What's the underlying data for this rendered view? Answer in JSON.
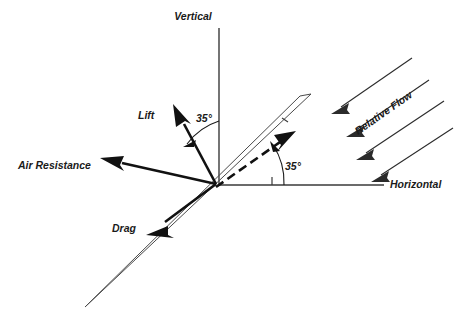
{
  "diagram": {
    "axes": [
      {
        "id": "vertical",
        "label": "Vertical"
      },
      {
        "id": "horizontal",
        "label": "Horizontal"
      }
    ],
    "vectors": [
      {
        "id": "lift",
        "label": "Lift"
      },
      {
        "id": "air-resistance",
        "label": "Air Resistance"
      },
      {
        "id": "drag",
        "label": "Drag"
      }
    ],
    "flow": {
      "label": "Relative Flow",
      "arrow_count": 4
    },
    "angles": [
      {
        "id": "lift-from-vertical",
        "label": "35°",
        "value": 35,
        "unit": "degrees"
      },
      {
        "id": "chord-from-horizontal",
        "label": "35°",
        "value": 35,
        "unit": "degrees"
      }
    ],
    "colors": {
      "background": "#ffffff",
      "ink": "#111111",
      "axis": "#3a3a3a",
      "airfoil": "#4a4a4a",
      "flow": "#2b2b2b"
    }
  }
}
